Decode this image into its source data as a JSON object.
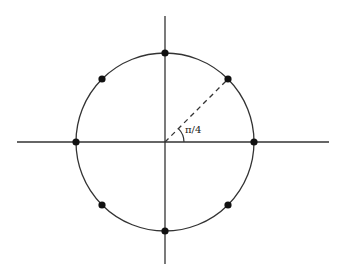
{
  "diagram": {
    "center": [
      165,
      142
    ],
    "radius": 89,
    "axes": {
      "horizontal": {
        "x1": 17,
        "x2": 329,
        "y": 142
      },
      "vertical": {
        "x": 165,
        "y1": 16,
        "y2": 264
      }
    },
    "points_count": 8,
    "angle_label": "π/4",
    "colors": {
      "line": "#333333",
      "dot": "#111111",
      "background": "#ffffff"
    }
  }
}
